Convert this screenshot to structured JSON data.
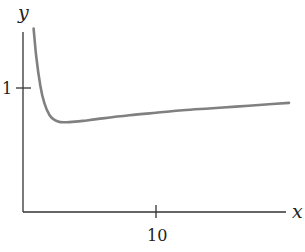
{
  "chart_data": {
    "type": "line",
    "title": "",
    "xlabel": "x",
    "ylabel": "y",
    "x_ticks": [
      {
        "value": 10,
        "label": "10"
      }
    ],
    "y_ticks": [
      {
        "value": 1,
        "label": "1"
      }
    ],
    "xlim": [
      0,
      20.5
    ],
    "ylim": [
      0,
      1.5
    ],
    "grid": false,
    "legend": null,
    "series": [
      {
        "name": "curve",
        "color": "#808080",
        "x": [
          0.8,
          1.0,
          1.3,
          1.6,
          2.0,
          2.4,
          2.8,
          3.5,
          4.5,
          6,
          8,
          10,
          12,
          14,
          16,
          18,
          20
        ],
        "y": [
          1.48,
          1.25,
          1.02,
          0.88,
          0.78,
          0.74,
          0.725,
          0.725,
          0.735,
          0.755,
          0.78,
          0.8,
          0.82,
          0.835,
          0.85,
          0.865,
          0.88
        ]
      }
    ]
  },
  "axes": {
    "x_label": "x",
    "y_label": "y",
    "x_tick_label": "10",
    "y_tick_label": "1"
  },
  "colors": {
    "axis": "#333333",
    "curve": "#808080"
  }
}
